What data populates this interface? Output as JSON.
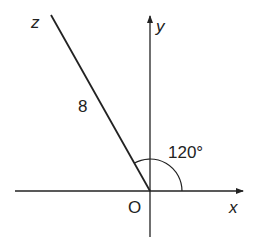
{
  "diagram": {
    "type": "vector-angle-diagram",
    "axes": {
      "x_label": "x",
      "y_label": "y",
      "origin_label": "O"
    },
    "vector": {
      "label": "z",
      "magnitude_label": "8",
      "angle_label": "120°"
    },
    "colors": {
      "stroke": "#222222",
      "background": "#ffffff"
    }
  }
}
